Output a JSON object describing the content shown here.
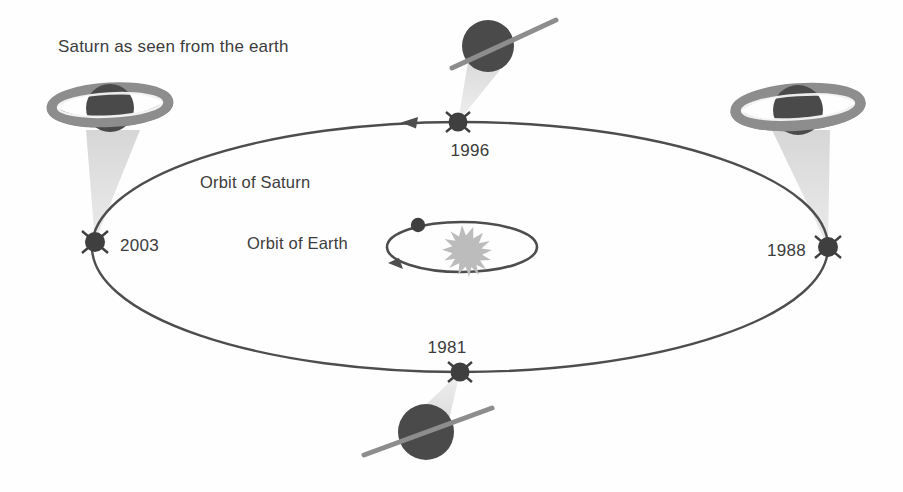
{
  "figure": {
    "title": "Saturn as seen from the earth",
    "orbit_saturn_label": "Orbit of Saturn",
    "orbit_earth_label": "Orbit of Earth",
    "background_color": "#fefefe",
    "colors": {
      "planet_body": "#4a4a4a",
      "ring": "#8d8d8d",
      "light_cone": "#dcdcdc",
      "orbit_line": "#4d4d4d",
      "sun": "#b9b9b9",
      "text": "#3c3c3c"
    }
  },
  "orbits": {
    "saturn_orbit": {
      "name": "Orbit of Saturn",
      "center_x": 460,
      "center_y": 247,
      "radius_x": 368,
      "radius_y": 125,
      "direction": "counterclockwise",
      "arrow_label": "arrow at top pointing left"
    },
    "earth_orbit": {
      "name": "Orbit of Earth",
      "center_x": 462,
      "center_y": 247,
      "radius_x": 75,
      "radius_y": 25,
      "direction": "counterclockwise"
    }
  },
  "sun": {
    "name": "Sun",
    "x": 462,
    "y": 247,
    "radius": 22,
    "spikes": 17
  },
  "earth": {
    "name": "Earth",
    "x": 418,
    "y": 225,
    "radius": 7
  },
  "positions": [
    {
      "year": "2003",
      "marker_x": 95,
      "marker_y": 242,
      "label_x": 120,
      "label_y": 251,
      "label_anchor": "start",
      "planet_x": 110,
      "planet_y": 108,
      "planet_radius": 24,
      "ring_style": "open",
      "ring_rx": 58,
      "ring_ry": 17,
      "ring_tilt_deg": -3,
      "ring_description": "rings wide open, tilted ellipse"
    },
    {
      "year": "1996",
      "marker_x": 458,
      "marker_y": 122,
      "label_x": 470,
      "label_y": 155,
      "label_anchor": "middle",
      "planet_x": 488,
      "planet_y": 46,
      "planet_radius": 26,
      "ring_style": "edge-on",
      "ring_length": 122,
      "ring_tilt_deg": -32,
      "ring_description": "rings edge-on, thin tilted line"
    },
    {
      "year": "1988",
      "marker_x": 828,
      "marker_y": 247,
      "label_x": 806,
      "label_y": 256,
      "label_anchor": "end",
      "planet_x": 798,
      "planet_y": 110,
      "planet_radius": 25,
      "ring_style": "open",
      "ring_rx": 62,
      "ring_ry": 18,
      "ring_tilt_deg": -4,
      "ring_description": "rings wide open, tilted ellipse"
    },
    {
      "year": "1981",
      "marker_x": 460,
      "marker_y": 372,
      "label_x": 447,
      "label_y": 353,
      "label_anchor": "middle",
      "planet_x": 426,
      "planet_y": 432,
      "planet_radius": 28,
      "ring_style": "edge-on",
      "ring_length": 130,
      "ring_tilt_deg": -22,
      "ring_description": "rings edge-on, thin tilted line"
    }
  ]
}
